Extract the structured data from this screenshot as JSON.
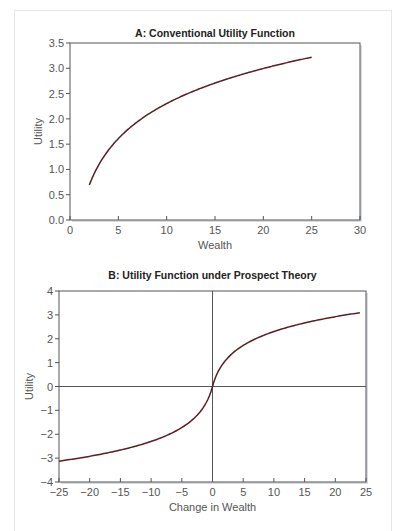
{
  "chart_data": [
    {
      "type": "line",
      "title": "A: Conventional Utility Function",
      "xlabel": "Wealth",
      "ylabel": "Utility",
      "xlim": [
        0,
        30
      ],
      "ylim": [
        0.0,
        3.5
      ],
      "xticks": [
        "0",
        "5",
        "10",
        "15",
        "20",
        "25",
        "30"
      ],
      "yticks": [
        "0.0",
        "0.5",
        "1.0",
        "1.5",
        "2.0",
        "2.5",
        "3.0",
        "3.5"
      ],
      "grid": false,
      "series": [
        {
          "name": "Utility",
          "color": "#5a1e24",
          "x": [
            2,
            3,
            4,
            5,
            6,
            8,
            10,
            12,
            15,
            18,
            20,
            22,
            25
          ],
          "y": [
            0.69,
            1.1,
            1.39,
            1.61,
            1.79,
            2.08,
            2.3,
            2.48,
            2.71,
            2.89,
            3.0,
            3.09,
            3.22
          ]
        }
      ]
    },
    {
      "type": "line",
      "title": "B: Utility Function under Prospect Theory",
      "xlabel": "Change in Wealth",
      "ylabel": "Utility",
      "xlim": [
        -25,
        25
      ],
      "ylim": [
        -4,
        4
      ],
      "xticks": [
        "−25",
        "−20",
        "−15",
        "−10",
        "−5",
        "0",
        "5",
        "10",
        "15",
        "20",
        "25"
      ],
      "yticks": [
        "−4",
        "−3",
        "−2",
        "−1",
        "0",
        "1",
        "2",
        "3",
        "4"
      ],
      "grid": false,
      "reference_lines": {
        "x": 0,
        "y": 0
      },
      "series": [
        {
          "name": "Utility",
          "color": "#5a1e24",
          "x": [
            -25,
            -20,
            -15,
            -10,
            -5,
            -2,
            -1,
            0,
            1,
            2,
            5,
            10,
            15,
            20,
            24
          ],
          "y": [
            -3.3,
            -3.04,
            -2.77,
            -2.4,
            -1.8,
            -1.1,
            -0.7,
            0,
            0.7,
            1.1,
            1.8,
            2.4,
            2.77,
            3.04,
            3.22
          ]
        }
      ]
    }
  ]
}
